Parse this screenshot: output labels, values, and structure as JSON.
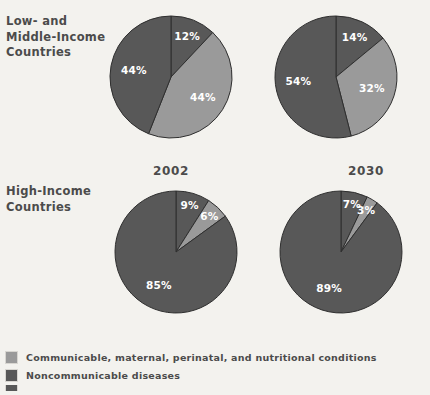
{
  "colors": {
    "background": "#f3f2ee",
    "communicable": "#9a9a9a",
    "noncommunicable": "#585858",
    "injuries": "#585858",
    "slice_outline": "#2f2f2f",
    "text": "#4b4b4b",
    "label_text": "#ffffff"
  },
  "row_labels": [
    {
      "text": "Low- and\nMiddle-Income\nCountries"
    },
    {
      "text": "High-Income\nCountries"
    }
  ],
  "year_captions": [
    {
      "text": "2002"
    },
    {
      "text": "2030"
    }
  ],
  "legend": {
    "items": [
      {
        "label": "Communicable, maternal, perinatal, and nutritional conditions",
        "color": "#9a9a9a",
        "swatch_name": "communicable"
      },
      {
        "label": "Noncommunicable diseases",
        "color": "#585858",
        "swatch_name": "noncommunicable"
      },
      {
        "label": "",
        "color": "#585858",
        "swatch_name": "injuries"
      }
    ]
  },
  "chart_data": [
    {
      "type": "pie",
      "title": "Low- and Middle-Income Countries 2002",
      "row": "Low- and Middle-Income Countries",
      "year": "2002",
      "start_angle": 0,
      "direction": "clockwise",
      "labels": [
        "12%",
        "44%",
        "44%"
      ],
      "values": [
        12,
        44,
        44
      ],
      "categories": [
        "Injuries",
        "Communicable, maternal, perinatal, and nutritional conditions",
        "Noncommunicable diseases"
      ],
      "colors": [
        "#585858",
        "#9a9a9a",
        "#585858"
      ]
    },
    {
      "type": "pie",
      "title": "Low- and Middle-Income Countries 2030",
      "row": "Low- and Middle-Income Countries",
      "year": "2030",
      "start_angle": 0,
      "direction": "clockwise",
      "labels": [
        "14%",
        "32%",
        "54%"
      ],
      "values": [
        14,
        32,
        54
      ],
      "categories": [
        "Injuries",
        "Communicable, maternal, perinatal, and nutritional conditions",
        "Noncommunicable diseases"
      ],
      "colors": [
        "#585858",
        "#9a9a9a",
        "#585858"
      ]
    },
    {
      "type": "pie",
      "title": "High-Income Countries 2002",
      "row": "High-Income Countries",
      "year": "2002",
      "start_angle": 0,
      "direction": "clockwise",
      "labels": [
        "9%",
        "6%",
        "85%"
      ],
      "values": [
        9,
        6,
        85
      ],
      "categories": [
        "Injuries",
        "Communicable, maternal, perinatal, and nutritional conditions",
        "Noncommunicable diseases"
      ],
      "colors": [
        "#585858",
        "#9a9a9a",
        "#585858"
      ]
    },
    {
      "type": "pie",
      "title": "High-Income Countries 2030",
      "row": "High-Income Countries",
      "year": "2030",
      "start_angle": 0,
      "direction": "clockwise",
      "labels": [
        "7%",
        "3%",
        "89%"
      ],
      "values": [
        7,
        3,
        89
      ],
      "categories": [
        "Injuries",
        "Communicable, maternal, perinatal, and nutritional conditions",
        "Noncommunicable diseases"
      ],
      "colors": [
        "#585858",
        "#9a9a9a",
        "#585858"
      ]
    }
  ]
}
